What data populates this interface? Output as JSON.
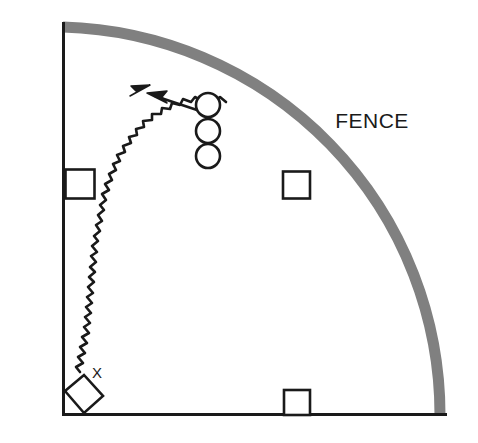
{
  "figure": {
    "type": "field-diagram",
    "width": 478,
    "height": 443,
    "background_color": "#ffffff"
  },
  "labels": {
    "fence": "FENCE",
    "marker_x": "X"
  },
  "colors": {
    "ink": "#1a1a1a",
    "fence": "#808080",
    "background": "#ffffff"
  },
  "geometry": {
    "corner": {
      "x": 63,
      "y": 415
    },
    "foul_line_left": {
      "x1": 63,
      "y1": 22,
      "x2": 63,
      "y2": 415
    },
    "foul_line_bottom": {
      "x1": 63,
      "y1": 415,
      "x2": 447,
      "y2": 415
    },
    "fence_arc": {
      "start": {
        "x": 63,
        "y": 22
      },
      "end": {
        "x": 440,
        "y": 415
      },
      "radius": 388,
      "stroke_width": 11
    },
    "squares": [
      {
        "name": "square-left-line",
        "cx": 80,
        "cy": 184,
        "size": 29
      },
      {
        "name": "square-center-field",
        "cx": 296,
        "cy": 185,
        "size": 27
      },
      {
        "name": "square-bottom-line",
        "cx": 297,
        "cy": 403,
        "size": 26
      }
    ],
    "circles": [
      {
        "name": "circle-top",
        "cx": 208,
        "cy": 105,
        "r": 12
      },
      {
        "name": "circle-middle",
        "cx": 208,
        "cy": 131,
        "r": 12
      },
      {
        "name": "circle-bottom",
        "cx": 208,
        "cy": 156,
        "r": 12
      }
    ],
    "diamond": {
      "cx": 82,
      "cy": 396,
      "half": 22
    },
    "wavy_path_arrow_tip": {
      "x": 148,
      "y": 86
    },
    "straight_arrow_tip": {
      "x": 148,
      "y": 95
    },
    "straight_arrow_tail": {
      "x": 197,
      "y": 110
    }
  }
}
